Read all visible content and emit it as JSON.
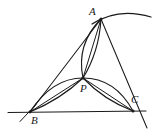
{
  "figure": {
    "background_color": "#ffffff",
    "stroke_color": "#1a1a1a",
    "width": 161,
    "height": 137,
    "labels": {
      "a": "A",
      "b": "B",
      "c": "C",
      "p": "P"
    },
    "label_positions": {
      "a": {
        "x": 89,
        "y": 6
      },
      "b": {
        "x": 31,
        "y": 115
      },
      "c": {
        "x": 131,
        "y": 94
      },
      "p": {
        "x": 80,
        "y": 83
      }
    },
    "points": {
      "a": {
        "x": 101,
        "y": 19
      },
      "b": {
        "x": 30,
        "y": 112
      },
      "c": {
        "x": 133,
        "y": 111
      },
      "p": {
        "x": 83,
        "y": 78
      }
    },
    "segments": [
      {
        "name": "side-ab",
        "from": "B",
        "to": "A"
      },
      {
        "name": "side-ac-extended",
        "from": "A",
        "to": "beyond-C"
      },
      {
        "name": "baseline-bc-extended",
        "from": "left-of-B",
        "to": "right-of-C"
      },
      {
        "name": "cevian-ap",
        "from": "A",
        "to": "P"
      },
      {
        "name": "cevian-bp",
        "from": "B",
        "to": "P"
      },
      {
        "name": "cevian-cp",
        "from": "C",
        "to": "P"
      }
    ],
    "arcs": [
      {
        "name": "lens-ap-left",
        "from": "A",
        "to": "P",
        "bulge": "left"
      },
      {
        "name": "lens-ap-right",
        "from": "A",
        "to": "P",
        "bulge": "right"
      },
      {
        "name": "lens-bp-upper",
        "from": "B",
        "to": "P",
        "bulge": "up"
      },
      {
        "name": "lens-bp-lower",
        "from": "B",
        "to": "P",
        "bulge": "down"
      },
      {
        "name": "lens-pc-upper",
        "from": "P",
        "to": "C",
        "bulge": "up"
      },
      {
        "name": "lens-pc-lower",
        "from": "P",
        "to": "C",
        "bulge": "down"
      },
      {
        "name": "free-arc-through-a",
        "from": "A",
        "to": "upper-right",
        "bulge": "up"
      }
    ]
  }
}
